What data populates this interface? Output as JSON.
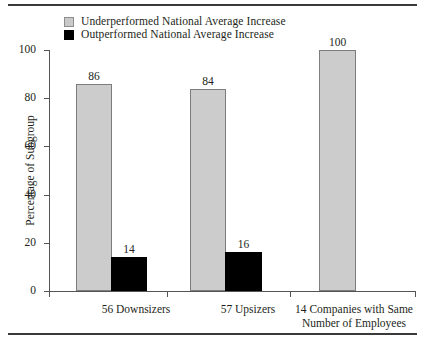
{
  "figure": {
    "has_top_rule": true,
    "has_bottom_rule": true,
    "gray_color": "#cccccc",
    "black_color": "#000000",
    "text_color": "#231f20"
  },
  "legend": {
    "items": [
      {
        "swatch": "gray-square-icon",
        "label": "Underperformed National Average Increase"
      },
      {
        "swatch": "black-square-icon",
        "label": "Outperformed National Average Increase"
      }
    ]
  },
  "axes": {
    "ylabel": "Percentage of Subgroup",
    "yticks": [
      "100",
      "80",
      "60",
      "40",
      "20",
      "0"
    ],
    "xlabel": ""
  },
  "chart_data": {
    "type": "bar",
    "title": "",
    "xlabel": "",
    "ylabel": "Percentage of Subgroup",
    "ylim": [
      0,
      100
    ],
    "yticks": [
      0,
      20,
      40,
      60,
      80,
      100
    ],
    "grid": false,
    "legend_position": "top-left",
    "categories": [
      "56 Downsizers",
      "57 Upsizers",
      "14 Companies with Same Number of Employees"
    ],
    "category_lines": [
      [
        "56 Downsizers"
      ],
      [
        "57 Upsizers"
      ],
      [
        "14 Companies with Same",
        "Number of Employees"
      ]
    ],
    "series": [
      {
        "name": "Underperformed National Average Increase",
        "color": "#cccccc",
        "values": [
          86,
          84,
          100
        ],
        "labels": [
          "86",
          "84",
          "100"
        ]
      },
      {
        "name": "Outperformed National Average Increase",
        "color": "#000000",
        "values": [
          14,
          16,
          null
        ],
        "labels": [
          "14",
          "16",
          ""
        ]
      }
    ]
  },
  "bars": [
    {
      "name": "bar-downsizers-under",
      "series": "gray",
      "value_label": "86",
      "left": 27,
      "width": 36,
      "height_pct": 86
    },
    {
      "name": "bar-downsizers-over",
      "series": "black",
      "value_label": "14",
      "left": 62,
      "width": 36,
      "height_pct": 14
    },
    {
      "name": "bar-upsizers-under",
      "series": "gray",
      "value_label": "84",
      "left": 141,
      "width": 36,
      "height_pct": 84
    },
    {
      "name": "bar-upsizers-over",
      "series": "black",
      "value_label": "16",
      "left": 176,
      "width": 37,
      "height_pct": 16
    },
    {
      "name": "bar-same-under",
      "series": "gray",
      "value_label": "100",
      "left": 270,
      "width": 37,
      "height_pct": 100
    }
  ],
  "category_labels": [
    {
      "name": "cat-label-downsizers",
      "line1": "56 Downsizers",
      "line2": "",
      "left": 18,
      "width": 138
    },
    {
      "name": "cat-label-upsizers",
      "line1": "57 Upsizers",
      "line2": "",
      "left": 130,
      "width": 138
    },
    {
      "name": "cat-label-same",
      "line1": "14 Companies with Same",
      "line2": "Number of Employees",
      "left": 240,
      "width": 130
    }
  ]
}
